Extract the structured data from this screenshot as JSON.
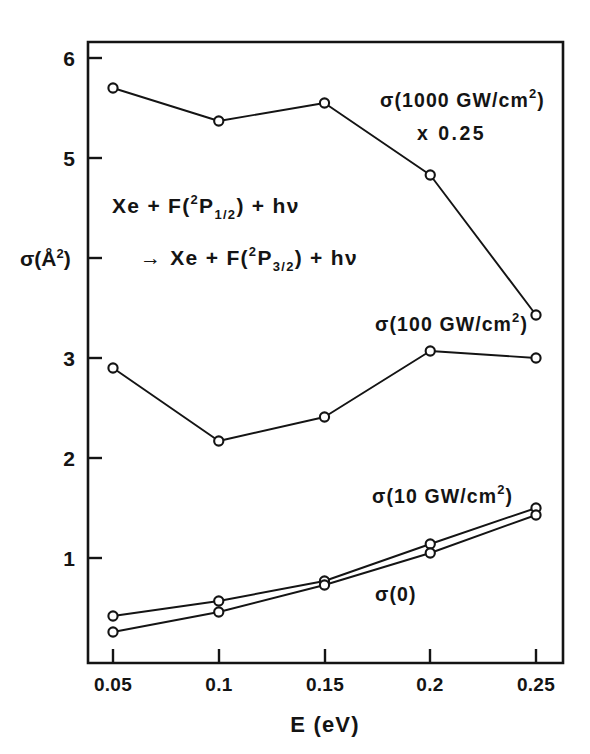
{
  "chart_data": {
    "type": "line",
    "title": "",
    "xlabel": "E (eV)",
    "ylabel": "σ(Å²)",
    "xlim": [
      0.0375,
      0.2656
    ],
    "ylim": [
      0,
      6.0
    ],
    "grid": false,
    "legend": "inline-annotations",
    "x": [
      0.05,
      0.1,
      0.15,
      0.2,
      0.25
    ],
    "xtick_labels": [
      "0.05",
      "0.1",
      "0.15",
      "0.2",
      "0.25"
    ],
    "ytick_values": [
      1,
      2,
      3,
      4,
      5,
      6
    ],
    "ytick_labels": [
      "1",
      "2",
      "3",
      "4",
      "5",
      "6"
    ],
    "ytick_label_visible": [
      true,
      true,
      false,
      true,
      true,
      true
    ],
    "series": [
      {
        "name": "σ(1000 GW/cm²) x 0.25",
        "values": [
          5.7,
          5.37,
          5.55,
          4.83,
          3.43
        ],
        "marker": "open-circle"
      },
      {
        "name": "σ(100 GW/cm²)",
        "values": [
          2.9,
          2.17,
          2.41,
          3.07,
          3.0
        ],
        "marker": "open-circle"
      },
      {
        "name": "σ(10 GW/cm²)",
        "values": [
          0.42,
          0.57,
          0.77,
          1.14,
          1.5
        ],
        "marker": "open-circle"
      },
      {
        "name": "σ(0)",
        "values": [
          0.26,
          0.46,
          0.73,
          1.05,
          1.43
        ],
        "marker": "open-circle"
      }
    ],
    "annotations": [
      {
        "id": "ann-1000",
        "line1": "σ(1000  GW/cm",
        "sup": "2",
        "line1_end": ")",
        "line2": "x  0.25"
      },
      {
        "id": "ann-100",
        "line1": "σ(100  GW/cm",
        "sup": "2",
        "line1_end": ")"
      },
      {
        "id": "ann-10",
        "line1": "σ(10  GW/cm",
        "sup": "2",
        "line1_end": ")"
      },
      {
        "id": "ann-0",
        "line1": "σ(0)"
      }
    ],
    "reaction": {
      "line1_a": "Xe + F(",
      "line1_sup": "2",
      "line1_b": "P",
      "line1_sub": "1/2",
      "line1_c": ") + hν",
      "line2_arrow": "→",
      "line2_a": "Xe + F(",
      "line2_sup": "2",
      "line2_b": "P",
      "line2_sub": "3/2",
      "line2_c": ") + hν"
    }
  },
  "axes": {
    "x_title": "E (eV)",
    "y_title_sigma": "σ(",
    "y_title_angstrom": "Å",
    "y_title_exp": "2",
    "y_title_close": ")"
  },
  "xticks": [
    "0.05",
    "0.1",
    "0.15",
    "0.2",
    "0.25"
  ],
  "yticks": {
    "t6": "6",
    "t5": "5",
    "t3": "3",
    "t2": "2",
    "t1": "1"
  },
  "annotations": {
    "a1000_main": "σ(1000  GW/cm",
    "a1000_sup": "2",
    "a1000_close": ")",
    "a1000_factor": "x  0.25",
    "a100_main": "σ(100  GW/cm",
    "a100_sup": "2",
    "a100_close": ")",
    "a10_main": "σ(10  GW/cm",
    "a10_sup": "2",
    "a10_close": ")",
    "a0_main": "σ(0)"
  },
  "reaction": {
    "l1_a": "Xe + F(",
    "l1_sup": "2",
    "l1_b": "P",
    "l1_sub": "1/2",
    "l1_c": ") + hν",
    "l2_arrow": "→",
    "l2_a": "Xe + F(",
    "l2_sup": "2",
    "l2_b": "P",
    "l2_sub": "3/2",
    "l2_c": ") + hν"
  }
}
